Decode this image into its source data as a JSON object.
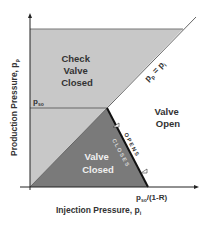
{
  "diagram": {
    "type": "gas-lift valve operating envelope",
    "axes": {
      "x_label": "Injection Pressure, p",
      "x_label_sub": "i",
      "y_label": "Production Pressure, p",
      "y_label_sub": "p"
    },
    "regions": {
      "check_valve_closed": [
        "Check",
        "Valve",
        "Closed"
      ],
      "valve_open": [
        "Valve",
        "Open"
      ],
      "valve_closed": [
        "Valve",
        "Closed"
      ]
    },
    "lines": {
      "diagonal_label_main": "p",
      "diagonal_label_sub1": "p",
      "diagonal_label_eq": " = p",
      "diagonal_label_sub2": "i",
      "pso_label": "p",
      "pso_label_sub": "so",
      "x_intercept_label": "p",
      "x_intercept_sub": "so",
      "x_intercept_rest": "/(1-R)"
    },
    "boundary_labels": {
      "opens": "O P E N S",
      "closes": "C L O S E S"
    },
    "colors": {
      "light_region": "#c8c8c8",
      "dark_region": "#7a7a7a",
      "line": "#555555",
      "boundary": "#111111",
      "text": "#333333",
      "text_on_dark": "#f0f0f0"
    }
  }
}
